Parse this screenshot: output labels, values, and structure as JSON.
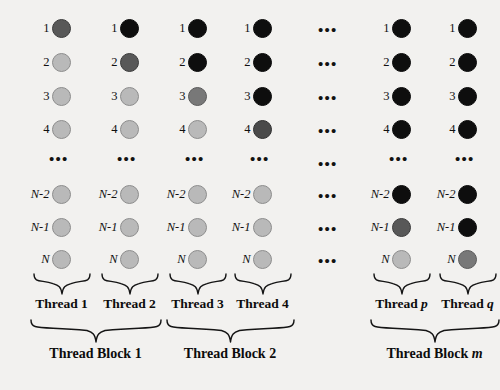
{
  "figure": {
    "background_color": "#f2f1ef"
  },
  "row_labels": [
    "1",
    "2",
    "3",
    "4",
    "N-2",
    "N-1",
    "N"
  ],
  "row_ellipsis": "•••",
  "column_ellipsis": "•••",
  "shades": {
    "light": "#b9b9b9",
    "mid": "#9a9a9a",
    "mid2": "#787878",
    "dark": "#585858",
    "dark2": "#4a4a4a",
    "black": "#0e0e0e"
  },
  "columns": [
    {
      "id": "thread-1",
      "label": "Thread 1",
      "label_italic_suffix": "",
      "cells": [
        "dark",
        "light",
        "light",
        "light",
        "light",
        "light",
        "light"
      ]
    },
    {
      "id": "thread-2",
      "label": "Thread 2",
      "label_italic_suffix": "",
      "cells": [
        "black",
        "dark",
        "light",
        "light",
        "light",
        "light",
        "light"
      ]
    },
    {
      "id": "thread-3",
      "label": "Thread 3",
      "label_italic_suffix": "",
      "cells": [
        "black",
        "black",
        "mid2",
        "light",
        "light",
        "light",
        "light"
      ]
    },
    {
      "id": "thread-4",
      "label": "Thread 4",
      "label_italic_suffix": "",
      "cells": [
        "black",
        "black",
        "black",
        "dark2",
        "light",
        "light",
        "light"
      ]
    },
    {
      "id": "thread-p",
      "label": "Thread ",
      "label_italic_suffix": "p",
      "cells": [
        "black",
        "black",
        "black",
        "black",
        "black",
        "dark",
        "light"
      ]
    },
    {
      "id": "thread-q",
      "label": "Thread ",
      "label_italic_suffix": "q",
      "cells": [
        "black",
        "black",
        "black",
        "black",
        "black",
        "black",
        "mid2"
      ]
    }
  ],
  "blocks": [
    {
      "id": "block-1",
      "label": "Thread Block 1",
      "label_italic_suffix": ""
    },
    {
      "id": "block-2",
      "label": "Thread Block 2",
      "label_italic_suffix": ""
    },
    {
      "id": "block-m",
      "label": "Thread Block ",
      "label_italic_suffix": "m"
    }
  ]
}
